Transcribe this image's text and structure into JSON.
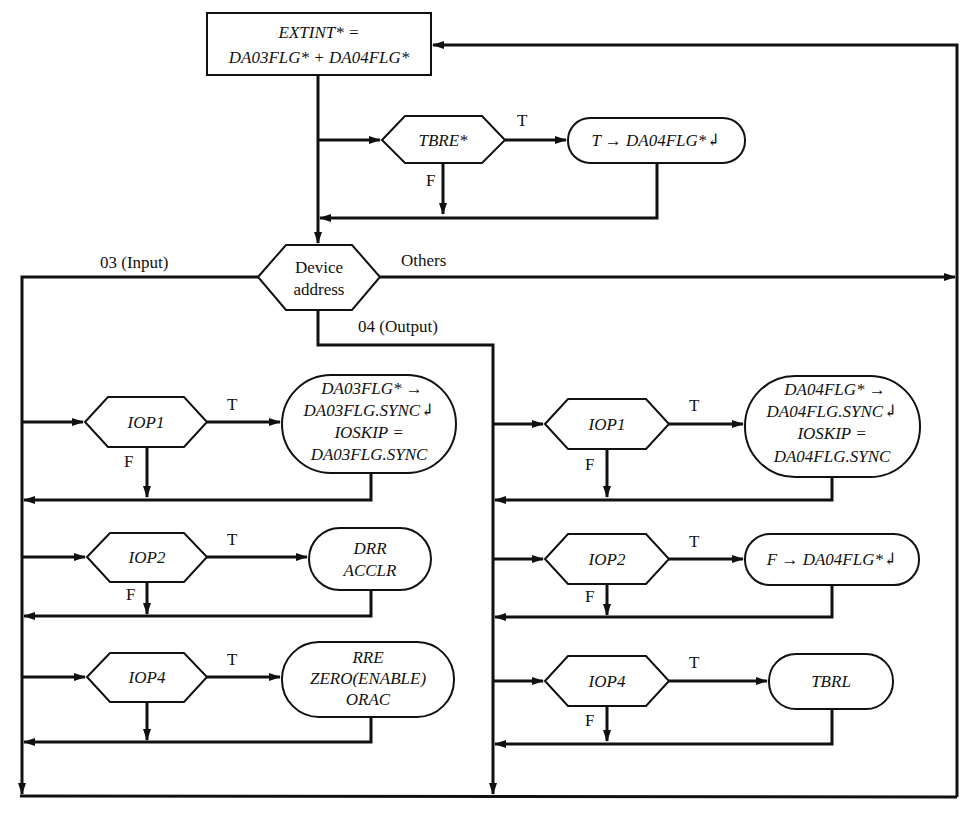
{
  "diagram": {
    "type": "flowchart",
    "start_box": {
      "line1": "EXTINT* =",
      "line2": "DA03FLG* + DA04FLG*"
    },
    "tbre_check": {
      "condition": "TBRE*",
      "true_label": "T",
      "false_label": "F",
      "true_action": "T → DA04FLG*↲"
    },
    "device_switch": {
      "line1": "Device",
      "line2": "address",
      "branch_input": "03 (Input)",
      "branch_output": "04 (Output)",
      "branch_others": "Others"
    },
    "input_column": {
      "steps": [
        {
          "condition": "IOP1",
          "true_label": "T",
          "false_label": "F",
          "action_lines": [
            "DA03FLG* →",
            "DA03FLG.SYNC↲",
            "IOSKIP =",
            "DA03FLG.SYNC"
          ]
        },
        {
          "condition": "IOP2",
          "true_label": "T",
          "false_label": "F",
          "action_lines": [
            "DRR",
            "ACCLR"
          ]
        },
        {
          "condition": "IOP4",
          "true_label": "T",
          "false_label": "",
          "action_lines": [
            "RRE",
            "ZERO(ENABLE)",
            "ORAC"
          ]
        }
      ]
    },
    "output_column": {
      "steps": [
        {
          "condition": "IOP1",
          "true_label": "T",
          "false_label": "F",
          "action_lines": [
            "DA04FLG* →",
            "DA04FLG.SYNC↲",
            "IOSKIP =",
            "DA04FLG.SYNC"
          ]
        },
        {
          "condition": "IOP2",
          "true_label": "T",
          "false_label": "F",
          "action_lines": [
            "F → DA04FLG*↲"
          ]
        },
        {
          "condition": "IOP4",
          "true_label": "T",
          "false_label": "F",
          "action_lines": [
            "TBRL"
          ]
        }
      ]
    }
  }
}
